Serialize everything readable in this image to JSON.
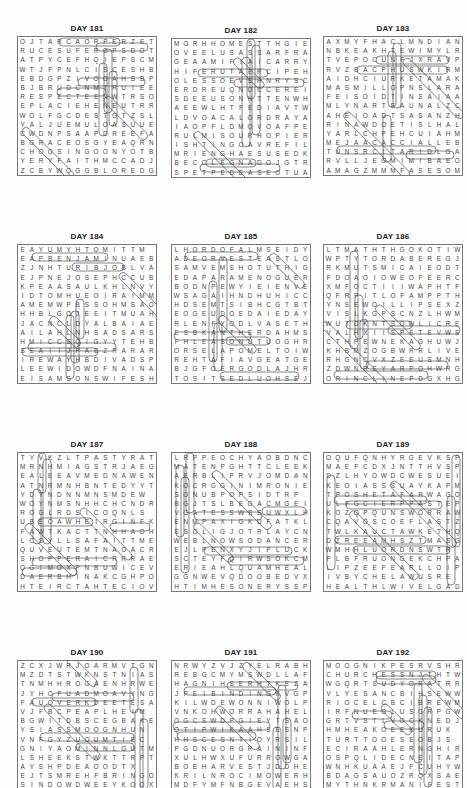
{
  "page": {
    "puzzles": [
      {
        "title": "DAY 181",
        "rows": [
          "OJTARCAORPERZET",
          "RUCESUFEROPSDOT",
          "ATPYCEFHQIEPSCM",
          "WTJFPNLCISCESHB",
          "EBDGPZIVOOAHSBP",
          "BJBRUDCNMTRUIEE",
          "RESPECTEENWTRSO",
          "EPLACIEHENEUTRR",
          "WOLFGCDESTGTZSL",
          "YALJUEMULOASUUE",
          "CWDNPSAAPDREEFA",
          "BGRACEOSGYEAQRN",
          "CHOOSINGOONYOTB",
          "YERYFAITHMCCADJ",
          "ZCBYWQGGBLOREDG"
        ]
      },
      {
        "title": "DAY 182",
        "rows": [
          "MORHHOMESTTHGIE",
          "OVEELUSASSARFRA",
          "GEAAMIFIAICARRY",
          "HIFERUTAERCIPEH",
          "OLESSOEVEHNRYSC",
          "ERDREUQNOCCEREI",
          "SDEEUSONHTTENWH",
          "AEEWLHTFEDIAVTW",
          "LDVOACALORDRAYA",
          "IAOPFLDMOVOAFPE",
          "RULMISOURHOPIER",
          "ISHTINGOAVREFIL",
          "MRIENGHAESUSEDK",
          "BECCLEGNADOJGTR",
          "SPETPEDEASEOTUA"
        ]
      },
      {
        "title": "DAY 183",
        "rows": [
          "AXMYFHACLMNDIAN",
          "NBKEAKHTEWIMYLR",
          "TVEPOCUNFJXRAVP",
          "RVZBACPHUSWKIRM",
          "AIDHCIURKETAMAK",
          "MASMILLOPNSLARAM",
          "FEISOIDTINSAIAA",
          "MLYNARTEAUNALZC",
          "AHEIOADTSASANZH",
          "RINAWDOETISLHAL",
          "YARLCHPEHCUIAHM",
          "MEJAACACCIALLEB",
          "TUNSRCITARIDLGA",
          "RVLLJEGMIMIBAEO",
          "AMAGZMMMFASESOM"
        ]
      },
      {
        "title": "DAY 184",
        "rows": [
          "EAYUMYHTOMITTM",
          "EAPBENJAMINUAEB",
          "ZJNHTURIBJOBLVA",
          "EJPNEJOSEPHCCUB",
          "KPEAASAULKHLNVY",
          "IDTOMHUEOIRAIMM",
          "AMEMWPBSSOHMSAO",
          "HHBLGOJEEITMUAHS",
          "JACNCLDYALBAIAE",
          "AILAHLNHSADSARS",
          "HMICCSQIGYYTEHBO",
          "SEAIIJPAEZRARAR",
          "IREWAYHBDIVADSP",
          "LEEWIDOWDFNAINA",
          "EISAMSONSWIFESH"
        ]
      },
      {
        "title": "DAY 185",
        "rows": [
          "LHORDOFALMSEIDY",
          "ADEORVESTEASTLO",
          "SAMVEMSHOTUTHIG",
          "EDAPARAMENOGUER",
          "BODNPEWYIEIENVE",
          "WSAGAIHNDHUHICC",
          "HDSEMTSIBHCGTBT",
          "EOGEUDOEDAIEDAY",
          "RLENFYODLVASETH",
          "ESBKANTHERDAHMS",
          "FHLEASONUTUOGHR",
          "ORSELAPOMELTOIW",
          "REHTAFIAVGEATGE",
          "BJGFOERGODLAJHR",
          "TOSITSEDLUOHSEJ"
        ]
      },
      {
        "title": "DAY 186",
        "rows": [
          "LTMATHTHGOKOTIW",
          "WPTYTORDABEREGJ",
          "RKMUTSMICAIEODT",
          "FDOAOIOWEOFEERC",
          "XMFOCTIIIWAPHTF",
          "QFRPITLOFAMPPTH",
          "YNSEWOILLIPSEXZA",
          "VISLKGPSCNZLHWM",
          "WUTOKNTSOWLICRED",
          "VALHXIISPETEVWS",
          "CTHPEWNEKAGHUWJ",
          "KHBMZOGBWRRLIVE",
          "RHGNCVXZEEUSMNH",
          "ZDWNREYARPOHWRG",
          "ORINCLINEPDGXHG"
        ]
      },
      {
        "title": "DAY 187",
        "rows": [
          "TYVKZLTPASTYRAT",
          "MRNHMIAGSTRJAEG",
          "EALEEAVMEDNAWEN",
          "ATNRMNHBNTEDYYT",
          "YDYNDNNMNSMDEW",
          "WOYNMSNHHCHCNDR",
          "ROGLRDSICOQNLS",
          "UBEOAWHEIRGINFK",
          "FAWTKACTTNHHAOH",
          "LCSYLLSAFAITTMET",
          "QUVEUTEMTNAOACR",
          "SHOPPERAICRRRAE",
          "OGIMOXPNBUWICEV",
          "DAERBHINAKCGHPO",
          "HTEIRCTAHTECIOV"
        ]
      },
      {
        "title": "DAY 188",
        "rows": [
          "LRPPEOCHYAOBDNC",
          "MATENPGHTTCLEEK",
          "AERBLIPRVJOMDAN",
          "KOCRGGINIMRONIEA",
          "SONUBPOPSIDTRP",
          "BGJTSLBEGACMGEIDX",
          "VGATESSWSEUWXLH",
          "ENMPAXIGKUFATKL",
          "ESOLIGJOTRLAYCN",
          "WEBLNOWSODANCERD",
          "EJLPENXYJIPLUCK",
          "SCTEYFQIRWSOKCM",
          "ERIEAHLQUAMHEAL",
          "GGNWEVQDOOBEDVXB",
          "HTIMHESONERYSSP"
        ]
      },
      {
        "title": "DAY 189",
        "rows": [
          "OQUFQNHYRGEVKSP",
          "MAEFCDXJNTTHVSP",
          "DZLHYOWDCWESUEI",
          "KEOIASSSUAYKAPM",
          "TPOSHETAFARWAGOI",
          "ULFGCIERPPASTEPO",
          "KOZQPQUNSWORRAW",
          "CQAVOSCOEFLASTZ",
          "TWLKAUCTAWKETHQ",
          "DZREEAMHSZTMASGT",
          "WMHHLUORDNSWTR",
          "PLBFRUONGEKCHPAA",
          "LIPZEEFEARLLOIP",
          "IVBYCHELAWUSRE",
          "HEALTHLWIVELGAD"
        ]
      },
      {
        "title": "DAY 190",
        "rows": [
          "ZCXJWRJOARMVTGN",
          "MZDTSTWKNSTNIAS",
          "TNMHHROGAENHRWE",
          "JYHOFUADMOAVYNG",
          "FAUOVERKDEETESA",
          "VJFBCPEAPLHEIM",
          "BGWITDBSCEGBAKEI",
          "YSIASSMOOGNHUN",
          "VNFGYZUOUMTIEC",
          "GNIYAOMINNLGUTMG",
          "LSHEEKSTWKTTRPT",
          "AYSHPDEAOODTX",
          "EJTSMREHFBRINGO",
          "SINDOWDWEEYKOOX",
          "KGLLEMANFPDAQUE"
        ]
      },
      {
        "title": "DAY 191",
        "rows": [
          "NRWYZVJZYELRABH",
          "REBGCMYMSWDLLAF",
          "HAGNIHSERHTKEZA",
          "JPEIBINDINGKVGP",
          "KILWDEWONNIWOLP",
          "VNKOHWORRAHAHEL",
          "OGCSWDPGIEYTSAO",
          "QTIPWIKAAHSESNP",
          "HHSCESNTIOYRSIL",
          "PGDNUORGRAININF",
          "XULHWXUFURROWGA",
          "BOEHARVESTJDDHE",
          "KRILNROCIMOWERH",
          "MDFYMFNBGEVAEHS",
          "WTBYGLGNIMAFSGH"
        ]
      },
      {
        "title": "DAY 192",
        "rows": [
          "MOOGNIKPESRVSHR",
          "CHURCHESSNJTHTW",
          "WGQRTSUDYORATRR",
          "VLYESANCBIHSEWW",
          "RIOCELCBCIBREWM",
          "IRFNUEGLUSGRPGW",
          "GRTVSTLVOCKNEDJ",
          "HMHEAKOEEKURUK",
          "TURTTOOESEOBJS",
          "ECIRAAHLERNGHIR",
          "OSPQLIDECNEITAPO",
          "WNHKUAAEJFCUHYW",
          "BDAGSAUOZRQXSAE",
          "MYTHNKRMANIFEST",
          "GSUFFEROGBWHICH"
        ]
      }
    ]
  }
}
